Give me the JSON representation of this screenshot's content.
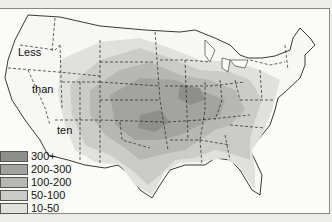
{
  "map": {
    "subject": "Contiguous United States shaded by frequency",
    "western_label": [
      "Less",
      "than",
      "ten"
    ]
  },
  "legend": {
    "items": [
      {
        "label": "300+",
        "color": "#8e8e8c"
      },
      {
        "label": "200-300",
        "color": "#a3a3a1"
      },
      {
        "label": "100-200",
        "color": "#b7b7b5"
      },
      {
        "label": "50-100",
        "color": "#cbcbc9"
      },
      {
        "label": "10-50",
        "color": "#e0e0de"
      }
    ]
  }
}
